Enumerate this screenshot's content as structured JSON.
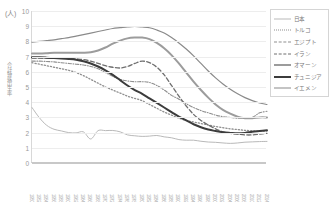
{
  "unit_label": "(人)",
  "y_axis_title": "合計特殊出生率",
  "legend": {
    "items": [
      {
        "label": "日本",
        "color": "#b9b9b9",
        "style": "solid",
        "width": 1.0
      },
      {
        "label": "トルコ",
        "color": "#8f8f8f",
        "style": "dotted",
        "width": 1.3
      },
      {
        "label": "エジプト",
        "color": "#8f8f8f",
        "style": "dashdot",
        "width": 1.1
      },
      {
        "label": "イラン",
        "color": "#6f6f6f",
        "style": "dashed",
        "width": 1.3
      },
      {
        "label": "オマーン",
        "color": "#9c9c9c",
        "style": "solid",
        "width": 2.0
      },
      {
        "label": "チュニジア",
        "color": "#3c3c3c",
        "style": "solid",
        "width": 2.0
      },
      {
        "label": "イエメン",
        "color": "#8a8a8a",
        "style": "solid",
        "width": 1.2
      }
    ]
  },
  "chart_data": {
    "type": "line",
    "title": "",
    "xlabel": "",
    "ylabel": "合計特殊出生率",
    "unit": "人",
    "ylim": [
      0,
      10
    ],
    "ytick_step": 1,
    "yticks": [
      0,
      1,
      2,
      3,
      4,
      5,
      6,
      7,
      8,
      9,
      10
    ],
    "grid": true,
    "legend_position": "right",
    "x": [
      1950,
      1952,
      1954,
      1956,
      1958,
      1960,
      1962,
      1964,
      1966,
      1968,
      1970,
      1972,
      1974,
      1976,
      1978,
      1980,
      1982,
      1984,
      1986,
      1988,
      1990,
      1992,
      1994,
      1996,
      1998,
      2000,
      2002,
      2004,
      2006,
      2008,
      2010,
      2012,
      2014
    ],
    "xticklabels": [
      "1950",
      "1952",
      "1954",
      "1956",
      "1958",
      "1960",
      "1962",
      "1964",
      "1966",
      "1968",
      "1970",
      "1972",
      "1974",
      "1976",
      "1978",
      "1980",
      "1982",
      "1984",
      "1986",
      "1988",
      "1990",
      "1992",
      "1994",
      "1996",
      "1998",
      "2000",
      "2002",
      "2004",
      "2006",
      "2008",
      "2010",
      "2012",
      "2014"
    ],
    "series": [
      {
        "name": "日本",
        "color": "#b9b9b9",
        "style": "solid",
        "width": 1.0,
        "values": [
          3.65,
          2.98,
          2.48,
          2.22,
          2.11,
          2.0,
          1.98,
          2.05,
          1.58,
          2.13,
          2.13,
          2.14,
          2.05,
          1.85,
          1.79,
          1.75,
          1.77,
          1.81,
          1.72,
          1.66,
          1.54,
          1.5,
          1.5,
          1.43,
          1.38,
          1.36,
          1.32,
          1.29,
          1.32,
          1.37,
          1.39,
          1.41,
          1.42
        ]
      },
      {
        "name": "トルコ",
        "color": "#8f8f8f",
        "style": "dotted",
        "width": 1.3,
        "values": [
          6.6,
          6.5,
          6.4,
          6.3,
          6.2,
          6.1,
          5.95,
          5.75,
          5.5,
          5.25,
          5.0,
          4.8,
          4.6,
          4.4,
          4.25,
          4.1,
          3.85,
          3.6,
          3.35,
          3.15,
          2.95,
          2.8,
          2.7,
          2.6,
          2.5,
          2.4,
          2.32,
          2.25,
          2.2,
          2.15,
          2.12,
          2.1,
          2.1
        ]
      },
      {
        "name": "エジプト",
        "color": "#8f8f8f",
        "style": "dashdot",
        "width": 1.1,
        "values": [
          6.7,
          6.7,
          6.68,
          6.65,
          6.6,
          6.55,
          6.5,
          6.45,
          6.35,
          6.2,
          5.95,
          5.7,
          5.5,
          5.4,
          5.35,
          5.35,
          5.3,
          5.1,
          4.8,
          4.45,
          4.2,
          3.9,
          3.65,
          3.45,
          3.3,
          3.15,
          3.05,
          3.0,
          2.95,
          2.95,
          3.0,
          3.3,
          3.4
        ]
      },
      {
        "name": "イラン",
        "color": "#6f6f6f",
        "style": "dashed",
        "width": 1.3,
        "values": [
          6.9,
          6.9,
          6.9,
          6.9,
          6.9,
          6.9,
          6.85,
          6.8,
          6.7,
          6.55,
          6.4,
          6.3,
          6.25,
          6.35,
          6.55,
          6.7,
          6.6,
          6.3,
          5.8,
          5.1,
          4.4,
          3.75,
          3.2,
          2.8,
          2.5,
          2.25,
          2.05,
          1.95,
          1.9,
          1.85,
          1.85,
          1.9,
          1.95
        ]
      },
      {
        "name": "オマーン",
        "color": "#9c9c9c",
        "style": "solid",
        "width": 2.0,
        "values": [
          7.2,
          7.2,
          7.22,
          7.25,
          7.25,
          7.25,
          7.25,
          7.25,
          7.28,
          7.4,
          7.6,
          7.85,
          8.05,
          8.2,
          8.25,
          8.25,
          8.15,
          7.9,
          7.55,
          7.1,
          6.55,
          5.95,
          5.35,
          4.8,
          4.3,
          3.85,
          3.5,
          3.25,
          3.05,
          2.95,
          2.95,
          3.0,
          3.0
        ]
      },
      {
        "name": "チュニジア",
        "color": "#3c3c3c",
        "style": "solid",
        "width": 2.0,
        "values": [
          6.95,
          6.95,
          6.93,
          6.9,
          6.88,
          6.85,
          6.8,
          6.7,
          6.55,
          6.35,
          6.1,
          5.8,
          5.45,
          5.1,
          4.8,
          4.55,
          4.25,
          3.95,
          3.65,
          3.35,
          3.05,
          2.8,
          2.55,
          2.35,
          2.2,
          2.1,
          2.02,
          1.98,
          1.95,
          1.98,
          2.05,
          2.1,
          2.15
        ]
      },
      {
        "name": "イエメン",
        "color": "#8a8a8a",
        "style": "solid",
        "width": 1.2,
        "values": [
          7.95,
          8.0,
          8.05,
          8.1,
          8.18,
          8.25,
          8.35,
          8.45,
          8.55,
          8.65,
          8.75,
          8.85,
          8.9,
          8.95,
          8.98,
          8.95,
          8.9,
          8.75,
          8.55,
          8.25,
          7.9,
          7.5,
          7.05,
          6.55,
          6.05,
          5.6,
          5.2,
          4.85,
          4.55,
          4.3,
          4.1,
          3.95,
          3.85
        ]
      }
    ]
  }
}
